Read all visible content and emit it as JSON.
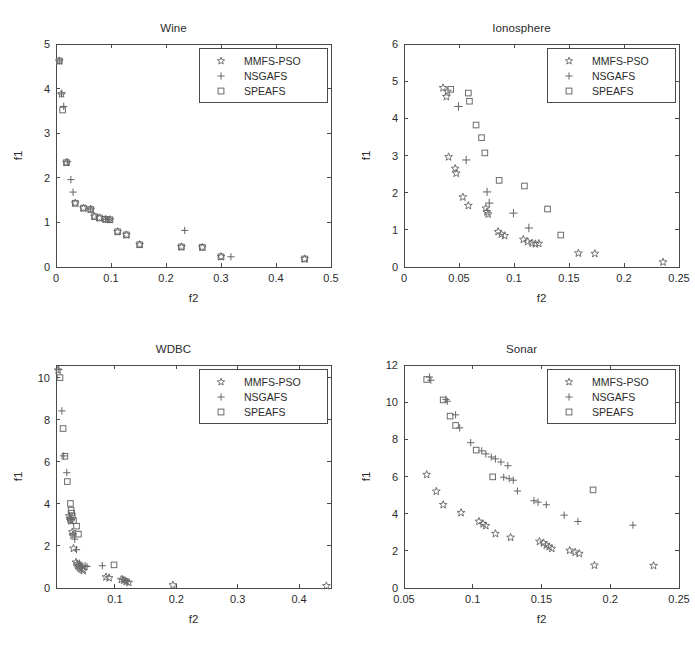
{
  "figure": {
    "width": 695,
    "height": 648,
    "background": "#ffffff",
    "marker_color": "#6b6b6b",
    "axis_color": "#4a4a4a",
    "text_color": "#2b2b2b"
  },
  "legend": {
    "entries": [
      {
        "label": "MMFS-PSO",
        "marker": "star"
      },
      {
        "label": "NSGAFS",
        "marker": "plus"
      },
      {
        "label": "SPEAFS",
        "marker": "square"
      }
    ]
  },
  "chart_data": [
    {
      "type": "scatter",
      "title": "Wine",
      "xlabel": "f2",
      "ylabel": "f1",
      "xlim": [
        0,
        0.5
      ],
      "ylim": [
        0,
        5
      ],
      "xticks": [
        0,
        0.1,
        0.2,
        0.3,
        0.4,
        0.5
      ],
      "xticklabels": [
        "0",
        "0.1",
        "0.2",
        "0.3",
        "0.4",
        "0.5"
      ],
      "yticks": [
        0,
        1,
        2,
        3,
        4,
        5
      ],
      "yticklabels": [
        "0",
        "1",
        "2",
        "3",
        "4",
        "5"
      ],
      "grid": false,
      "legend_position": "top-right",
      "series": [
        {
          "name": "MMFS-PSO",
          "marker": "star",
          "points": [
            [
              0.006,
              4.62
            ],
            [
              0.01,
              3.88
            ],
            [
              0.019,
              2.34
            ],
            [
              0.035,
              1.43
            ],
            [
              0.05,
              1.32
            ],
            [
              0.063,
              1.29
            ],
            [
              0.07,
              1.13
            ],
            [
              0.079,
              1.1
            ],
            [
              0.09,
              1.07
            ],
            [
              0.098,
              1.06
            ],
            [
              0.112,
              0.79
            ],
            [
              0.128,
              0.72
            ],
            [
              0.152,
              0.5
            ],
            [
              0.228,
              0.45
            ],
            [
              0.266,
              0.44
            ],
            [
              0.3,
              0.23
            ],
            [
              0.452,
              0.18
            ]
          ]
        },
        {
          "name": "NSGAFS",
          "marker": "plus",
          "points": [
            [
              0.006,
              4.62
            ],
            [
              0.01,
              3.88
            ],
            [
              0.014,
              3.6
            ],
            [
              0.021,
              2.36
            ],
            [
              0.027,
              1.96
            ],
            [
              0.031,
              1.68
            ],
            [
              0.063,
              1.3
            ],
            [
              0.09,
              1.07
            ],
            [
              0.098,
              1.06
            ],
            [
              0.234,
              0.82
            ],
            [
              0.318,
              0.23
            ]
          ]
        },
        {
          "name": "SPEAFS",
          "marker": "square",
          "points": [
            [
              0.006,
              4.62
            ],
            [
              0.012,
              3.52
            ],
            [
              0.019,
              2.34
            ],
            [
              0.035,
              1.43
            ],
            [
              0.05,
              1.32
            ],
            [
              0.063,
              1.29
            ],
            [
              0.07,
              1.13
            ],
            [
              0.079,
              1.1
            ],
            [
              0.09,
              1.07
            ],
            [
              0.098,
              1.06
            ],
            [
              0.112,
              0.79
            ],
            [
              0.128,
              0.72
            ],
            [
              0.152,
              0.5
            ],
            [
              0.228,
              0.45
            ],
            [
              0.266,
              0.44
            ],
            [
              0.3,
              0.23
            ],
            [
              0.452,
              0.18
            ]
          ]
        }
      ]
    },
    {
      "type": "scatter",
      "title": "Ionosphere",
      "xlabel": "f2",
      "ylabel": "f1",
      "xlim": [
        0,
        0.25
      ],
      "ylim": [
        0,
        6
      ],
      "xticks": [
        0,
        0.05,
        0.1,
        0.15,
        0.2,
        0.25
      ],
      "xticklabels": [
        "0",
        "0.05",
        "0.1",
        "0.15",
        "0.2",
        "0.25"
      ],
      "yticks": [
        0,
        1,
        2,
        3,
        4,
        5,
        6
      ],
      "yticklabels": [
        "0",
        "1",
        "2",
        "3",
        "4",
        "5",
        "6"
      ],
      "grid": false,
      "legend_position": "top-right",
      "series": [
        {
          "name": "MMFS-PSO",
          "marker": "star",
          "points": [
            [
              0.0355,
              4.82
            ],
            [
              0.0395,
              4.72
            ],
            [
              0.0385,
              4.58
            ],
            [
              0.0405,
              2.96
            ],
            [
              0.0465,
              2.65
            ],
            [
              0.0475,
              2.52
            ],
            [
              0.0535,
              1.88
            ],
            [
              0.0585,
              1.65
            ],
            [
              0.0745,
              1.58
            ],
            [
              0.0755,
              1.48
            ],
            [
              0.0765,
              1.42
            ],
            [
              0.0855,
              0.95
            ],
            [
              0.0885,
              0.88
            ],
            [
              0.0915,
              0.84
            ],
            [
              0.1085,
              0.74
            ],
            [
              0.1125,
              0.68
            ],
            [
              0.1165,
              0.64
            ],
            [
              0.1195,
              0.62
            ],
            [
              0.1225,
              0.63
            ],
            [
              0.1585,
              0.37
            ],
            [
              0.1735,
              0.36
            ],
            [
              0.2355,
              0.13
            ]
          ]
        },
        {
          "name": "NSGAFS",
          "marker": "plus",
          "points": [
            [
              0.0495,
              4.32
            ],
            [
              0.0565,
              2.88
            ],
            [
              0.0755,
              2.02
            ],
            [
              0.0775,
              1.72
            ],
            [
              0.0995,
              1.45
            ],
            [
              0.1135,
              1.05
            ]
          ]
        },
        {
          "name": "SPEAFS",
          "marker": "square",
          "points": [
            [
              0.0425,
              4.78
            ],
            [
              0.0585,
              4.68
            ],
            [
              0.0595,
              4.46
            ],
            [
              0.0655,
              3.82
            ],
            [
              0.0705,
              3.48
            ],
            [
              0.0735,
              3.07
            ],
            [
              0.0865,
              2.33
            ],
            [
              0.1095,
              2.18
            ],
            [
              0.1305,
              1.56
            ],
            [
              0.1425,
              0.86
            ]
          ]
        }
      ]
    },
    {
      "type": "scatter",
      "title": "WDBC",
      "xlabel": "f2",
      "ylabel": "f1",
      "xlim": [
        0.004,
        0.452
      ],
      "ylim": [
        0,
        10.6
      ],
      "xticks": [
        0.1,
        0.2,
        0.3,
        0.4
      ],
      "xticklabels": [
        "0.1",
        "0.2",
        "0.3",
        "0.4"
      ],
      "yticks": [
        0,
        2,
        4,
        6,
        8,
        10
      ],
      "yticklabels": [
        "0",
        "2",
        "4",
        "6",
        "8",
        "10"
      ],
      "grid": false,
      "legend_position": "top-right",
      "series": [
        {
          "name": "MMFS-PSO",
          "marker": "star",
          "points": [
            [
              0.0075,
              10.35
            ],
            [
              0.0255,
              3.42
            ],
            [
              0.0265,
              3.3
            ],
            [
              0.0275,
              3.22
            ],
            [
              0.0285,
              3.18
            ],
            [
              0.0305,
              2.66
            ],
            [
              0.0315,
              2.52
            ],
            [
              0.0325,
              1.88
            ],
            [
              0.0365,
              1.22
            ],
            [
              0.0385,
              1.14
            ],
            [
              0.0395,
              1.06
            ],
            [
              0.0415,
              1.02
            ],
            [
              0.0425,
              0.96
            ],
            [
              0.0445,
              0.92
            ],
            [
              0.0465,
              0.88
            ],
            [
              0.0485,
              0.82
            ],
            [
              0.0855,
              0.52
            ],
            [
              0.0905,
              0.48
            ],
            [
              0.1105,
              0.4
            ],
            [
              0.1145,
              0.36
            ],
            [
              0.1185,
              0.3
            ],
            [
              0.1225,
              0.26
            ],
            [
              0.1945,
              0.14
            ],
            [
              0.4445,
              0.1
            ]
          ]
        },
        {
          "name": "NSGAFS",
          "marker": "plus",
          "points": [
            [
              0.0085,
              10.38
            ],
            [
              0.0135,
              8.42
            ],
            [
              0.0165,
              6.28
            ],
            [
              0.0215,
              5.48
            ],
            [
              0.0285,
              3.3
            ],
            [
              0.0315,
              2.52
            ],
            [
              0.0345,
              2.32
            ],
            [
              0.0375,
              1.82
            ],
            [
              0.0425,
              1.18
            ],
            [
              0.0445,
              1.1
            ],
            [
              0.0465,
              1.04
            ],
            [
              0.0515,
              1.06
            ],
            [
              0.0545,
              1.02
            ],
            [
              0.0795,
              1.06
            ],
            [
              0.1125,
              0.42
            ],
            [
              0.1165,
              0.36
            ],
            [
              0.1205,
              0.3
            ]
          ]
        },
        {
          "name": "SPEAFS",
          "marker": "square",
          "points": [
            [
              0.0105,
              10.0
            ],
            [
              0.0155,
              7.58
            ],
            [
              0.0185,
              6.26
            ],
            [
              0.0225,
              5.06
            ],
            [
              0.0275,
              4.02
            ],
            [
              0.0285,
              3.7
            ],
            [
              0.0295,
              3.56
            ],
            [
              0.0305,
              3.42
            ],
            [
              0.0325,
              3.2
            ],
            [
              0.0375,
              2.94
            ],
            [
              0.0405,
              2.56
            ],
            [
              0.0985,
              1.1
            ]
          ]
        }
      ]
    },
    {
      "type": "scatter",
      "title": "Sonar",
      "xlabel": "f2",
      "ylabel": "f1",
      "xlim": [
        0.05,
        0.25
      ],
      "ylim": [
        0,
        12
      ],
      "xticks": [
        0.05,
        0.1,
        0.15,
        0.2,
        0.25
      ],
      "xticklabels": [
        "0.05",
        "0.1",
        "0.15",
        "0.2",
        "0.25"
      ],
      "yticks": [
        0,
        2,
        4,
        6,
        8,
        10,
        12
      ],
      "yticklabels": [
        "0",
        "2",
        "4",
        "6",
        "8",
        "10",
        "12"
      ],
      "grid": false,
      "legend_position": "top-right",
      "series": [
        {
          "name": "MMFS-PSO",
          "marker": "star",
          "points": [
            [
              0.0665,
              6.1
            ],
            [
              0.0735,
              5.2
            ],
            [
              0.0785,
              4.48
            ],
            [
              0.0915,
              4.05
            ],
            [
              0.1045,
              3.58
            ],
            [
              0.1075,
              3.45
            ],
            [
              0.1095,
              3.35
            ],
            [
              0.1165,
              2.92
            ],
            [
              0.1275,
              2.72
            ],
            [
              0.1485,
              2.5
            ],
            [
              0.1515,
              2.42
            ],
            [
              0.1535,
              2.3
            ],
            [
              0.1555,
              2.22
            ],
            [
              0.1575,
              2.12
            ],
            [
              0.1705,
              2.02
            ],
            [
              0.1745,
              1.92
            ],
            [
              0.1775,
              1.85
            ],
            [
              0.1885,
              1.22
            ],
            [
              0.2315,
              1.2
            ]
          ]
        },
        {
          "name": "NSGAFS",
          "marker": "plus",
          "points": [
            [
              0.0685,
              11.35
            ],
            [
              0.0695,
              11.18
            ],
            [
              0.0805,
              10.15
            ],
            [
              0.0815,
              10.05
            ],
            [
              0.0875,
              9.32
            ],
            [
              0.0905,
              8.62
            ],
            [
              0.0985,
              7.82
            ],
            [
              0.1065,
              7.38
            ],
            [
              0.1095,
              7.22
            ],
            [
              0.1135,
              7.05
            ],
            [
              0.1165,
              6.95
            ],
            [
              0.1205,
              6.78
            ],
            [
              0.1255,
              6.58
            ],
            [
              0.1225,
              5.96
            ],
            [
              0.1265,
              5.88
            ],
            [
              0.1295,
              5.8
            ],
            [
              0.1325,
              5.22
            ],
            [
              0.1445,
              4.7
            ],
            [
              0.1475,
              4.62
            ],
            [
              0.1535,
              4.48
            ],
            [
              0.1665,
              3.92
            ],
            [
              0.1765,
              3.58
            ],
            [
              0.2165,
              3.38
            ]
          ]
        },
        {
          "name": "SPEAFS",
          "marker": "square",
          "points": [
            [
              0.0665,
              11.22
            ],
            [
              0.0785,
              10.12
            ],
            [
              0.0835,
              9.25
            ],
            [
              0.0875,
              8.75
            ],
            [
              0.1025,
              7.42
            ],
            [
              0.1145,
              5.98
            ],
            [
              0.1875,
              5.28
            ]
          ]
        }
      ]
    }
  ]
}
